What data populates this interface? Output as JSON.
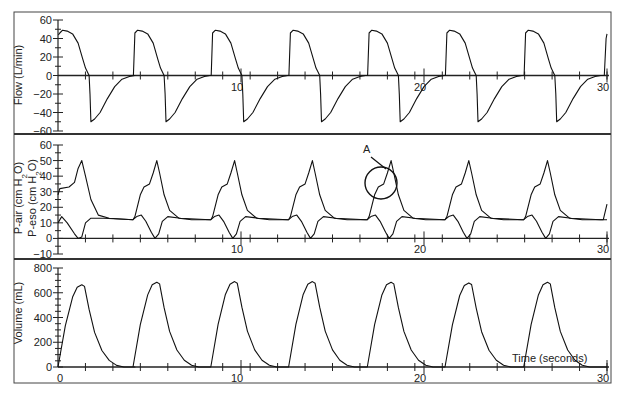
{
  "chart_data": [
    {
      "type": "line",
      "title": "",
      "ylabel": "Flow (L/min)",
      "xlabel": "",
      "ylim": [
        -60,
        60
      ],
      "yticks": [
        60,
        40,
        20,
        0,
        -20,
        -40,
        -60
      ],
      "xticks": [
        10,
        20,
        30
      ],
      "series": [
        {
          "name": "Flow",
          "description": "Square-ish inspiratory flow ~48 L/min, expiratory dip to ~-50 L/min, 7 breaths",
          "x": [
            0,
            0.3,
            1.2,
            1.6,
            1.8,
            2.6,
            3.5,
            4.2,
            4.5,
            5.3,
            5.8,
            6.1,
            6.9,
            7.8,
            8.5,
            8.8,
            9.7,
            10.2,
            10.4,
            11.2,
            12.2,
            13.0,
            13.2,
            14.1,
            14.6,
            14.8,
            15.6,
            16.6,
            17.4,
            17.6,
            18.5,
            19.0,
            19.2,
            20.0,
            21.0,
            21.8,
            22.0,
            22.9,
            23.4,
            23.6,
            24.4,
            25.4,
            26.3,
            26.5,
            27.4,
            27.9,
            28.1,
            28.9,
            29.7,
            30
          ],
          "y": [
            45,
            48,
            30,
            0,
            -50,
            -15,
            -2,
            0,
            48,
            30,
            0,
            -50,
            -15,
            -1,
            0,
            48,
            30,
            0,
            -50,
            -15,
            -1,
            0,
            48,
            30,
            0,
            -48,
            -15,
            -1,
            0,
            48,
            30,
            0,
            -50,
            -15,
            -1,
            0,
            48,
            30,
            0,
            -50,
            -15,
            -1,
            0,
            48,
            30,
            0,
            -50,
            -15,
            -1,
            45
          ]
        }
      ]
    },
    {
      "type": "line",
      "ylabel": "P-air (cm H2O) / P-eso (cm H2O)",
      "ylim": [
        -10,
        60
      ],
      "yticks": [
        60,
        50,
        40,
        30,
        20,
        10,
        0,
        -10
      ],
      "xticks": [
        10,
        20,
        30
      ],
      "annotations": [
        {
          "text": "A",
          "x": 17.5,
          "y": 38,
          "shape": "circle"
        }
      ],
      "series": [
        {
          "name": "P-air",
          "description": "Airway pressure: plateau ~33 then peak ~50 each breath, baseline ~12"
        },
        {
          "name": "P-eso",
          "description": "Esophageal pressure: baseline ~12, dip to ~0 after each inspiration, small bump ~15"
        }
      ]
    },
    {
      "type": "line",
      "ylabel": "Volume (mL)",
      "xlabel": "Time (seconds)",
      "ylim": [
        0,
        800
      ],
      "yticks": [
        800,
        600,
        400,
        200,
        0
      ],
      "xticks": [
        0,
        10,
        20,
        30
      ],
      "series": [
        {
          "name": "Volume",
          "description": "Tidal volume ~670-690 mL peaks every ~4.3 s",
          "peaks_x": [
            1.3,
            5.5,
            9.7,
            14.0,
            18.3,
            22.5,
            26.8
          ],
          "peaks_y": [
            665,
            685,
            690,
            690,
            685,
            680,
            685
          ]
        }
      ]
    }
  ],
  "panels": {
    "flow": {
      "ylabel": "Flow (L/min)",
      "ticks": [
        "60",
        "40",
        "20",
        "0",
        "−20",
        "−40",
        "−60"
      ],
      "xtick_labels": [
        "10",
        "20",
        "30"
      ]
    },
    "pressure": {
      "ylabel1": "P-air (cm H",
      "ylabel1_sub": "2",
      "ylabel1_end": "O)",
      "ylabel2": "P-eso (cm H",
      "ylabel2_sub": "2",
      "ylabel2_end": "O)",
      "ticks": [
        "60",
        "50",
        "40",
        "30",
        "20",
        "10",
        "0",
        "−10"
      ],
      "xtick_labels": [
        "10",
        "20",
        "30"
      ],
      "annotation": "A"
    },
    "volume": {
      "ylabel": "Volume (mL)",
      "ticks": [
        "800",
        "600",
        "400",
        "200",
        "0"
      ],
      "xtick_labels": [
        "0",
        "10",
        "20",
        "30"
      ],
      "xlabel": "Time (seconds)"
    }
  }
}
